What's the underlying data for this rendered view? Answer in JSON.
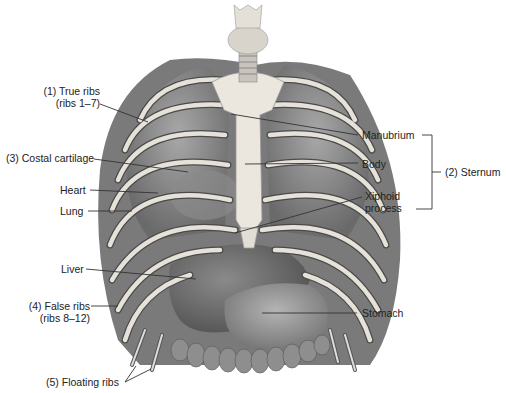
{
  "diagram": {
    "labels": {
      "true_ribs": [
        "(1) True ribs",
        "(ribs 1–7)"
      ],
      "costal_cartilage": "(3) Costal cartilage",
      "heart": "Heart",
      "lung": "Lung",
      "liver": "Liver",
      "false_ribs": [
        "(4) False ribs",
        "(ribs 8–12)"
      ],
      "floating_ribs": "(5) Floating ribs",
      "manubrium": "Manubrium",
      "body": "Body",
      "xiphoid": [
        "Xiphoid",
        "process"
      ],
      "sternum": "(2) Sternum",
      "stomach": "Stomach"
    },
    "colors": {
      "background": "#ffffff",
      "text": "#222222",
      "leader_line": "#333333",
      "bone": "#e8e4dc",
      "organ_dark": "#6e6e6e",
      "organ_mid": "#8c8c8c",
      "lung": "#9a9a9a"
    }
  }
}
